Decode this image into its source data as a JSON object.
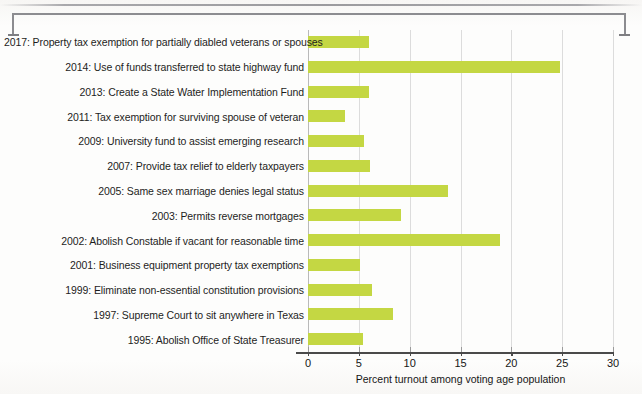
{
  "chart_data": {
    "type": "bar",
    "orientation": "horizontal",
    "title": "",
    "xlabel": "Percent turnout among voting age population",
    "ylabel": "",
    "xlim": [
      0,
      30
    ],
    "xticks": [
      0,
      5,
      10,
      15,
      20,
      25,
      30
    ],
    "xtick_labels": [
      "0",
      "5",
      "10",
      "15",
      "20",
      "25",
      "30"
    ],
    "grid": "vertical gridlines at each x tick",
    "legend": "none",
    "bar_color": "#c4d743",
    "categories": [
      "2017: Property tax exemption for partially diabled veterans or spouses",
      "2014: Use of funds transferred to state highway fund",
      "2013: Create a State Water Implementation Fund",
      "2011: Tax exemption for surviving spouse of veteran",
      "2009: University fund to assist emerging research",
      "2007: Provide tax relief to elderly taxpayers",
      "2005: Same sex marriage denies legal status",
      "2003: Permits reverse mortgages",
      "2002: Abolish Constable if vacant for reasonable time",
      "2001: Business equipment property tax exemptions",
      "1999: Eliminate non-essential constitution provisions",
      "1997: Supreme Court to sit anywhere in Texas",
      "1995: Abolish Office of State Treasurer"
    ],
    "values": [
      6.0,
      24.8,
      6.0,
      3.6,
      5.5,
      6.1,
      13.8,
      9.1,
      18.9,
      5.1,
      6.3,
      8.4,
      5.4
    ]
  }
}
